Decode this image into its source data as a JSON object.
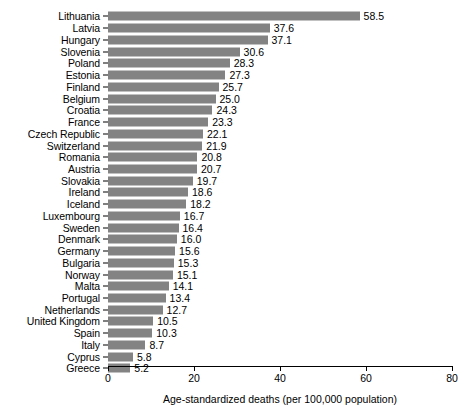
{
  "chart_data": {
    "type": "bar",
    "orientation": "horizontal",
    "title": "",
    "xlabel": "Age-standardized deaths (per 100,000 population)",
    "ylabel": "",
    "xlim": [
      0,
      80
    ],
    "xticks": [
      0,
      20,
      40,
      60,
      80
    ],
    "grid": false,
    "legend": null,
    "bar_color": "#838383",
    "value_labels": true,
    "categories": [
      "Lithuania",
      "Latvia",
      "Hungary",
      "Slovenia",
      "Poland",
      "Estonia",
      "Finland",
      "Belgium",
      "Croatia",
      "France",
      "Czech Republic",
      "Switzerland",
      "Romania",
      "Austria",
      "Slovakia",
      "Ireland",
      "Iceland",
      "Luxembourg",
      "Sweden",
      "Denmark",
      "Germany",
      "Bulgaria",
      "Norway",
      "Malta",
      "Portugal",
      "Netherlands",
      "United Kingdom",
      "Spain",
      "Italy",
      "Cyprus",
      "Greece"
    ],
    "values": [
      58.5,
      37.6,
      37.1,
      30.6,
      28.3,
      27.3,
      25.7,
      25.0,
      24.3,
      23.3,
      22.1,
      21.9,
      20.8,
      20.7,
      19.7,
      18.6,
      18.2,
      16.7,
      16.4,
      16.0,
      15.6,
      15.3,
      15.1,
      14.1,
      13.4,
      12.7,
      10.5,
      10.3,
      8.7,
      5.8,
      5.2
    ],
    "value_labels_text": [
      "58.5",
      "37.6",
      "37.1",
      "30.6",
      "28.3",
      "27.3",
      "25.7",
      "25.0",
      "24.3",
      "23.3",
      "22.1",
      "21.9",
      "20.8",
      "20.7",
      "19.7",
      "18.6",
      "18.2",
      "16.7",
      "16.4",
      "16.0",
      "15.6",
      "15.3",
      "15.1",
      "14.1",
      "13.4",
      "12.7",
      "10.5",
      "10.3",
      "8.7",
      "5.8",
      "5.2"
    ],
    "xtick_labels": [
      "0",
      "20",
      "40",
      "60",
      "80"
    ]
  }
}
